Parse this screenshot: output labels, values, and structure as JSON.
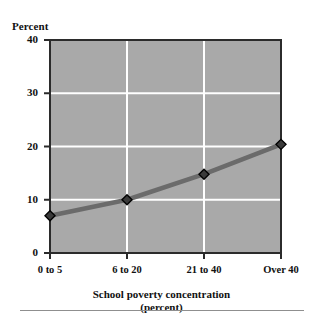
{
  "chart_data": {
    "type": "line",
    "title": "",
    "xlabel": "School poverty concentration",
    "xlabel_line2": "(percent)",
    "ylabel": "Percent",
    "categories": [
      "0 to 5",
      "6 to 20",
      "21 to 40",
      "Over 40"
    ],
    "values": [
      7,
      10,
      14.8,
      20.4
    ],
    "series": [
      {
        "name": "Percent",
        "values": [
          7,
          10,
          14.8,
          20.4
        ]
      }
    ],
    "ylim": [
      0,
      40
    ],
    "yticks": [
      40,
      30,
      20,
      10,
      0
    ],
    "ytick_labels": [
      "40",
      "30",
      "20",
      "10",
      "0"
    ],
    "gridlines": {
      "horizontal": [
        10,
        20,
        30
      ],
      "vertical": [
        "6 to 20",
        "21 to 40"
      ],
      "color": "#ffffff"
    },
    "legend": null,
    "legend_position": "none",
    "marker": "diamond",
    "colors": {
      "plot_background": "#a9a9a9",
      "line": "#6b6b6b",
      "marker_fill": "#3a3a3a",
      "marker_edge": "#000000",
      "axis": "#2b2b2b",
      "grid": "#ffffff",
      "text": "#111111",
      "footer_rule": "#8f8f8f"
    }
  },
  "figure": {
    "y_axis_caption": "Percent",
    "x_axis_title": "School poverty concentration",
    "x_axis_title_line2": "(percent)"
  }
}
